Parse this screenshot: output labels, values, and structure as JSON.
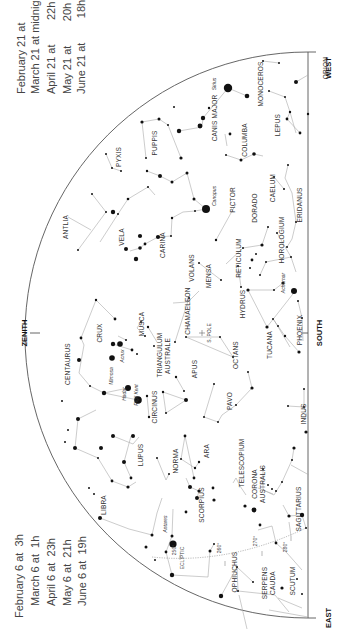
{
  "directions": {
    "west": "WEST",
    "east": "EAST",
    "south": "SOUTH",
    "zenith": "ZENITH",
    "pole": "S. POLE"
  },
  "times_west": [
    {
      "date": "February 21 at",
      "time": "2h"
    },
    {
      "date": "March 21 at midnight",
      "time": ""
    },
    {
      "date": "April 21 at",
      "time": "22h"
    },
    {
      "date": "May 21 at",
      "time": "20h"
    },
    {
      "date": "June 21 at",
      "time": "18h"
    }
  ],
  "times_east": [
    {
      "date": "February 6 at",
      "time": "3h"
    },
    {
      "date": "March 6 at",
      "time": "1h"
    },
    {
      "date": "April 6 at",
      "time": "23h"
    },
    {
      "date": "May 6 at",
      "time": "21h"
    },
    {
      "date": "June 6 at",
      "time": "19h"
    }
  ],
  "ecliptic": {
    "label": "ECLIPTIC",
    "marks": [
      "250°",
      "260°",
      "270°",
      "280°"
    ]
  },
  "constellations": [
    {
      "name": "ORION",
      "x": 328,
      "y": 68
    },
    {
      "name": "MONOCEROS",
      "x": 263,
      "y": 84
    },
    {
      "name": "LEPUS",
      "x": 280,
      "y": 125
    },
    {
      "name": "CANIS MAJOR",
      "x": 217,
      "y": 118
    },
    {
      "name": "COLUMBA",
      "x": 247,
      "y": 140
    },
    {
      "name": "PUPPIS",
      "x": 157,
      "y": 143
    },
    {
      "name": "PYXIS",
      "x": 121,
      "y": 157
    },
    {
      "name": "CAELUM",
      "x": 275,
      "y": 188
    },
    {
      "name": "ERIDANUS",
      "x": 302,
      "y": 205
    },
    {
      "name": "PICTOR",
      "x": 235,
      "y": 200
    },
    {
      "name": "DORADO",
      "x": 257,
      "y": 208
    },
    {
      "name": "ANTLIA",
      "x": 68,
      "y": 227
    },
    {
      "name": "VELA",
      "x": 124,
      "y": 237
    },
    {
      "name": "CARINA",
      "x": 165,
      "y": 245
    },
    {
      "name": "HOROLOGIUM",
      "x": 284,
      "y": 240
    },
    {
      "name": "RETICULUM",
      "x": 241,
      "y": 258
    },
    {
      "name": "VOLANS",
      "x": 194,
      "y": 268
    },
    {
      "name": "MENSA",
      "x": 211,
      "y": 276
    },
    {
      "name": "HYDRUS",
      "x": 245,
      "y": 304
    },
    {
      "name": "CHAMAELEON",
      "x": 190,
      "y": 311
    },
    {
      "name": "MUSCA",
      "x": 144,
      "y": 324
    },
    {
      "name": "CRUX",
      "x": 102,
      "y": 333
    },
    {
      "name": "PHOENIX",
      "x": 302,
      "y": 330
    },
    {
      "name": "TUCANA",
      "x": 272,
      "y": 345
    },
    {
      "name": "OCTANS",
      "x": 238,
      "y": 355
    },
    {
      "name": "CENTAURUS",
      "x": 70,
      "y": 364
    },
    {
      "name": "TRIANGULUM",
      "x": 162,
      "y": 355
    },
    {
      "name": "AUSTRALE",
      "x": 170,
      "y": 356
    },
    {
      "name": "APUS",
      "x": 197,
      "y": 369
    },
    {
      "name": "PAVO",
      "x": 232,
      "y": 401
    },
    {
      "name": "CIRCINUS",
      "x": 157,
      "y": 407
    },
    {
      "name": "INDUS",
      "x": 306,
      "y": 414
    },
    {
      "name": "ARA",
      "x": 209,
      "y": 451
    },
    {
      "name": "LUPUS",
      "x": 143,
      "y": 455
    },
    {
      "name": "NORMA",
      "x": 178,
      "y": 461
    },
    {
      "name": "TELESCOPIUM",
      "x": 244,
      "y": 463
    },
    {
      "name": "LIBRA",
      "x": 106,
      "y": 505
    },
    {
      "name": "CORONA",
      "x": 257,
      "y": 484
    },
    {
      "name": "AUSTRALIS",
      "x": 265,
      "y": 484
    },
    {
      "name": "SCORPIUS",
      "x": 204,
      "y": 505
    },
    {
      "name": "SAGITTARIUS",
      "x": 301,
      "y": 509
    },
    {
      "name": "OPHIUCHUS",
      "x": 237,
      "y": 572
    },
    {
      "name": "SERPENS",
      "x": 267,
      "y": 583
    },
    {
      "name": "CAUDA",
      "x": 275,
      "y": 583
    },
    {
      "name": "SCUTUM",
      "x": 295,
      "y": 581
    }
  ],
  "named_stars": [
    {
      "name": "Sirius",
      "x": 228,
      "y": 88,
      "lx": 216,
      "ly": 84
    },
    {
      "name": "Canopus",
      "x": 206,
      "y": 209,
      "lx": 216,
      "ly": 196
    },
    {
      "name": "Achernar",
      "x": 294,
      "y": 291,
      "lx": 285,
      "ly": 283
    },
    {
      "name": "Mimosa",
      "x": 112,
      "y": 358,
      "lx": 113,
      "ly": 376
    },
    {
      "name": "Acrux",
      "x": 120,
      "y": 344,
      "lx": 124,
      "ly": 356
    },
    {
      "name": "Hadar",
      "x": 128,
      "y": 388,
      "lx": 126,
      "ly": 394
    },
    {
      "name": "Rigil Kent",
      "x": 138,
      "y": 400,
      "lx": 138,
      "ly": 395
    },
    {
      "name": "Antares",
      "x": 173,
      "y": 544,
      "lx": 167,
      "ly": 524
    }
  ]
}
